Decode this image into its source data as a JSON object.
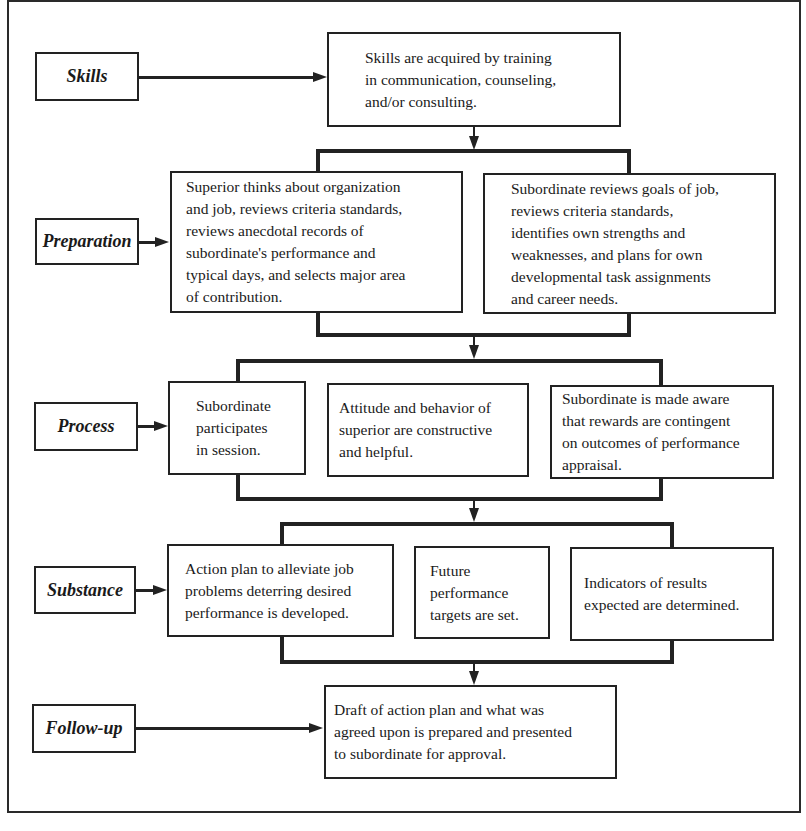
{
  "diagram": {
    "stages": [
      {
        "label": "Skills",
        "boxes": [
          "Skills are acquired by training\nin communication, counseling,\nand/or consulting."
        ]
      },
      {
        "label": "Preparation",
        "boxes": [
          "Superior thinks about organization\nand job, reviews criteria standards,\nreviews anecdotal records of\nsubordinate's performance and\ntypical days, and selects major area\nof contribution.",
          "Subordinate reviews goals of job,\nreviews criteria standards,\nidentifies own strengths and\nweaknesses, and plans for own\ndevelopmental task assignments\nand career needs."
        ]
      },
      {
        "label": "Process",
        "boxes": [
          "Subordinate\nparticipates\nin session.",
          "Attitude and behavior of\nsuperior are constructive\nand helpful.",
          "Subordinate is made aware\nthat rewards are contingent\non outcomes of performance\nappraisal."
        ]
      },
      {
        "label": "Substance",
        "boxes": [
          "Action plan to alleviate job\nproblems deterring desired\nperformance is developed.",
          "Future\nperformance\ntargets are set.",
          "Indicators of results\nexpected are determined."
        ]
      },
      {
        "label": "Follow-up",
        "boxes": [
          "Draft of action plan and what was\nagreed upon is prepared and presented\nto subordinate for approval."
        ]
      }
    ]
  }
}
